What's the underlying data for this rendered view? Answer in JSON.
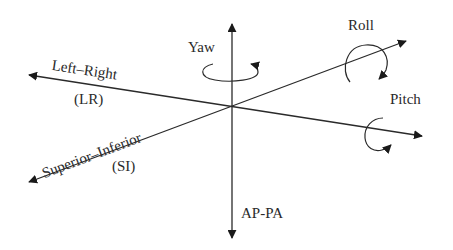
{
  "diagram": {
    "axes": [
      {
        "id": "ap-pa",
        "label": "AP-PA"
      },
      {
        "id": "left-right",
        "label": "Left–Right",
        "abbr": "(LR)"
      },
      {
        "id": "superior-inferior",
        "label": "Superior–Inferior",
        "abbr": "(SI)"
      }
    ],
    "rotations": [
      {
        "id": "yaw",
        "label": "Yaw"
      },
      {
        "id": "roll",
        "label": "Roll"
      },
      {
        "id": "pitch",
        "label": "Pitch"
      }
    ],
    "colors": {
      "stroke": "#2a2a2a",
      "background": "#ffffff"
    }
  }
}
